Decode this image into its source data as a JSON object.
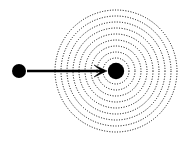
{
  "figure": {
    "title": "Point source emitting concentric circular wavefronts with incoming particle arrow",
    "width": 187,
    "height": 141,
    "background_color": "#ffffff",
    "ink_color": "#000000"
  },
  "chart_data": {
    "type": "scatter",
    "title": "",
    "subtitle": "",
    "xlabel": "",
    "ylabel": "",
    "xlim": [
      0,
      187
    ],
    "ylim": [
      0,
      141
    ],
    "grid": false,
    "legend": null,
    "axes_visible": false,
    "tick_labels_x": [],
    "tick_labels_y": [],
    "annotations": [],
    "elements": {
      "center_node": {
        "name": "target-particle",
        "cx": 116,
        "cy": 71,
        "r": 8.2,
        "fill": "#000000",
        "style": "solid-filled-circle"
      },
      "left_node": {
        "name": "incoming-particle",
        "cx": 19,
        "cy": 71,
        "r": 7.0,
        "fill": "#000000",
        "style": "solid-filled-circle"
      },
      "arrow": {
        "name": "motion-arrow",
        "x1": 27,
        "y1": 71,
        "x2": 107,
        "y2": 71,
        "stroke": "#000000",
        "stroke_width": 2.4,
        "head_style": "open-v-barb",
        "head_length": 13,
        "head_half_width": 6,
        "direction": "right"
      },
      "concentric_rings": {
        "name": "wavefront-rings",
        "cx": 116,
        "cy": 71,
        "count": 9,
        "radii": [
          13,
          19,
          25,
          31,
          37,
          43,
          49,
          55,
          61
        ],
        "stroke": "#000000",
        "stroke_width": 1.0,
        "line_style": "dotted",
        "dash_pattern": "1 1.6"
      }
    }
  }
}
